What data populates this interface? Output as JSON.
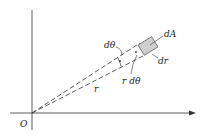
{
  "diagram": {
    "labels": {
      "origin": "O",
      "dtheta": "dθ",
      "dA": "dA",
      "dr": "dr",
      "rdtheta": "r dθ",
      "r": "r"
    },
    "colors": {
      "line": "#333333",
      "element_fill": "#cfcfcf"
    }
  }
}
